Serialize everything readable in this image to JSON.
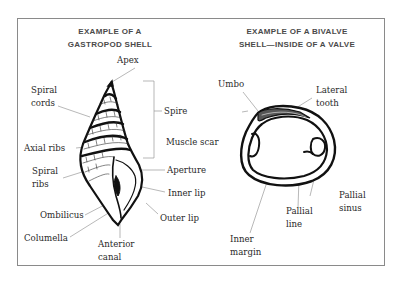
{
  "gastropod": {
    "title_line1": "EXAMPLE OF A",
    "title_line2": "GASTROPOD SHELL",
    "labels": {
      "apex": "Apex",
      "spiral_cords_1": "Spiral",
      "spiral_cords_2": "cords",
      "spire": "Spire",
      "axial_ribs": "Axial ribs",
      "spiral_ribs_1": "Spiral",
      "spiral_ribs_2": "ribs",
      "aperture": "Aperture",
      "inner_lip": "Inner lip",
      "outer_lip": "Outer lip",
      "ombilicus": "Ombilicus",
      "columella": "Columella",
      "anterior_canal_1": "Anterior",
      "anterior_canal_2": "canal"
    }
  },
  "bivalve": {
    "title_line1": "EXAMPLE OF A BIVALVE",
    "title_line2": "SHELL—INSIDE OF A VALVE",
    "labels": {
      "umbo": "Umbo",
      "lateral_tooth_1": "Lateral",
      "lateral_tooth_2": "tooth",
      "muscle_scar": "Muscle scar",
      "pallial_sinus_1": "Pallial",
      "pallial_sinus_2": "sinus",
      "pallial_line_1": "Pallial",
      "pallial_line_2": "line",
      "inner_margin_1": "Inner",
      "inner_margin_2": "margin"
    }
  }
}
